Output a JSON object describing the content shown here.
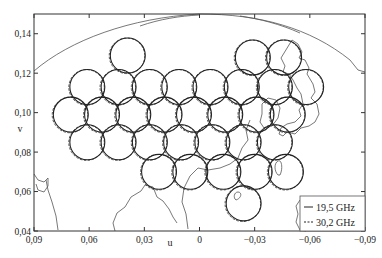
{
  "chart_data": {
    "type": "scatter",
    "title": "",
    "xlabel": "u",
    "ylabel": "v",
    "xlim": [
      0.09,
      -0.09
    ],
    "ylim": [
      0.04,
      0.15
    ],
    "x_ticks": [
      "0,09",
      "0,06",
      "0,03",
      "0",
      "−0,03",
      "−0,06",
      "−0,09"
    ],
    "x_tick_values": [
      0.09,
      0.06,
      0.03,
      0,
      -0.03,
      -0.06,
      -0.09
    ],
    "y_ticks": [
      "0,04",
      "0,06",
      "0,08",
      "0,10",
      "0,12",
      "0,14"
    ],
    "y_tick_values": [
      0.04,
      0.06,
      0.08,
      0.1,
      0.12,
      0.14
    ],
    "grid": false,
    "legend_position": "lower right",
    "legend": [
      {
        "label": "19,5 GHz",
        "style": "solid"
      },
      {
        "label": "30,2 GHz",
        "style": "dashed"
      }
    ],
    "beam_radius_uv": 0.0095,
    "beams": [
      {
        "u": 0.039,
        "v": 0.129
      },
      {
        "u": -0.029,
        "v": 0.128
      },
      {
        "u": -0.046,
        "v": 0.128
      },
      {
        "u": 0.061,
        "v": 0.113
      },
      {
        "u": 0.044,
        "v": 0.113
      },
      {
        "u": 0.027,
        "v": 0.113
      },
      {
        "u": 0.011,
        "v": 0.113
      },
      {
        "u": -0.006,
        "v": 0.113
      },
      {
        "u": -0.023,
        "v": 0.113
      },
      {
        "u": -0.041,
        "v": 0.113
      },
      {
        "u": -0.058,
        "v": 0.113
      },
      {
        "u": 0.07,
        "v": 0.099
      },
      {
        "u": 0.053,
        "v": 0.099
      },
      {
        "u": 0.036,
        "v": 0.099
      },
      {
        "u": 0.019,
        "v": 0.099
      },
      {
        "u": 0.003,
        "v": 0.099
      },
      {
        "u": -0.014,
        "v": 0.099
      },
      {
        "u": -0.031,
        "v": 0.099
      },
      {
        "u": -0.048,
        "v": 0.099
      },
      {
        "u": 0.061,
        "v": 0.085
      },
      {
        "u": 0.044,
        "v": 0.085
      },
      {
        "u": 0.027,
        "v": 0.085
      },
      {
        "u": 0.01,
        "v": 0.085
      },
      {
        "u": -0.007,
        "v": 0.085
      },
      {
        "u": -0.024,
        "v": 0.085
      },
      {
        "u": -0.041,
        "v": 0.085
      },
      {
        "u": 0.022,
        "v": 0.07
      },
      {
        "u": 0.005,
        "v": 0.07
      },
      {
        "u": -0.013,
        "v": 0.07
      },
      {
        "u": -0.03,
        "v": 0.07
      },
      {
        "u": -0.047,
        "v": 0.07
      },
      {
        "u": -0.024,
        "v": 0.054
      }
    ]
  }
}
